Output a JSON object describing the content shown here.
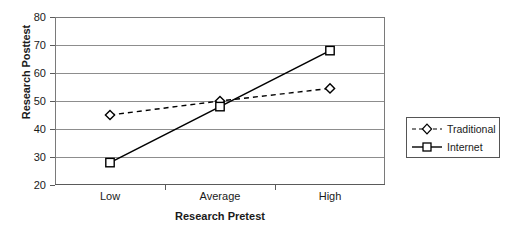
{
  "chart_data": {
    "type": "line",
    "title": "",
    "xlabel": "Research Pretest",
    "ylabel": "Research Posttest",
    "categories": [
      "Low",
      "Average",
      "High"
    ],
    "ylim": [
      20,
      80
    ],
    "yticks": [
      20,
      30,
      40,
      50,
      60,
      70,
      80
    ],
    "grid": true,
    "legend_position": "right",
    "series": [
      {
        "name": "Traditional",
        "values": [
          45,
          50,
          54.5
        ],
        "line_style": "dashed",
        "marker": "diamond",
        "color": "#000000"
      },
      {
        "name": "Internet",
        "values": [
          28,
          48,
          68
        ],
        "line_style": "solid",
        "marker": "square",
        "color": "#000000"
      }
    ]
  },
  "legend": {
    "entries": [
      {
        "label": "Traditional"
      },
      {
        "label": "Internet"
      }
    ]
  },
  "colors": {
    "axis": "#5a5a5a",
    "grid": "#8d8d8d",
    "series": "#000000",
    "text": "#1a1a1a",
    "background": "#ffffff"
  }
}
